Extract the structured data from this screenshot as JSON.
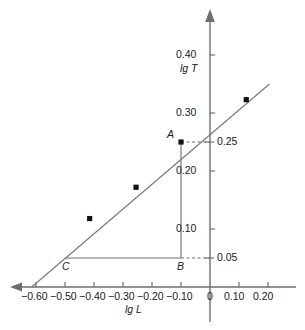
{
  "chart_data": {
    "type": "scatter",
    "title": "",
    "xlabel": "lg L",
    "ylabel": "lg T",
    "xlim": [
      -0.65,
      0.25
    ],
    "ylim": [
      0.0,
      0.44
    ],
    "grid": false,
    "legend": null,
    "x_ticks": [
      {
        "value": -0.6,
        "label": "−0.60"
      },
      {
        "value": -0.5,
        "label": "−0.50"
      },
      {
        "value": -0.4,
        "label": "−0.40"
      },
      {
        "value": -0.3,
        "label": "−0.30"
      },
      {
        "value": -0.2,
        "label": "−0.20"
      },
      {
        "value": -0.1,
        "label": "−0.10"
      },
      {
        "value": 0.0,
        "label": "0"
      },
      {
        "value": 0.1,
        "label": "0.10"
      },
      {
        "value": 0.2,
        "label": "0.20"
      }
    ],
    "y_ticks": [
      {
        "value": 0.1,
        "label": "0.10",
        "side": "left"
      },
      {
        "value": 0.2,
        "label": "0.20",
        "side": "left"
      },
      {
        "value": 0.3,
        "label": "0.30",
        "side": "left"
      },
      {
        "value": 0.4,
        "label": "0.40",
        "side": "left"
      }
    ],
    "reference_labels": [
      {
        "value": 0.25,
        "label": "0.25",
        "side": "right"
      },
      {
        "value": 0.05,
        "label": "0.05",
        "side": "right"
      }
    ],
    "points": [
      {
        "x": -0.415,
        "y": 0.118
      },
      {
        "x": -0.255,
        "y": 0.172
      },
      {
        "x": -0.1,
        "y": 0.25
      },
      {
        "x": 0.125,
        "y": 0.323
      }
    ],
    "fit_line": {
      "x_start": -0.615,
      "y_start": 0.0,
      "x_end": 0.205,
      "y_end": 0.35
    },
    "annotations": [
      {
        "name": "A",
        "label": "A",
        "x": -0.1,
        "y": 0.25
      },
      {
        "name": "B",
        "label": "B",
        "x": -0.1,
        "y": 0.05
      },
      {
        "name": "C",
        "label": "C",
        "x": -0.5,
        "y": 0.05
      }
    ],
    "construction_lines": [
      {
        "name": "segment-AB",
        "x1": -0.1,
        "y1": 0.25,
        "x2": -0.1,
        "y2": 0.05
      },
      {
        "name": "segment-CB",
        "x1": -0.5,
        "y1": 0.05,
        "x2": -0.1,
        "y2": 0.05
      }
    ],
    "dashed_leaders": [
      {
        "name": "leader-025",
        "from_x": -0.1,
        "to_x": 0.0,
        "y": 0.25
      },
      {
        "name": "leader-005",
        "from_x": -0.1,
        "to_x": 0.0,
        "y": 0.05
      }
    ],
    "colors": {
      "axis": "#6e6e6e",
      "line": "#7a7a7a",
      "marker": "#111111",
      "text": "#1a1a1a"
    }
  },
  "axis_labels": {
    "x_title": "lg L",
    "y_title": "lg T"
  }
}
